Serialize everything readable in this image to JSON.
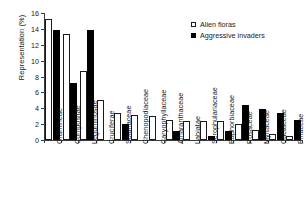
{
  "chart_data": {
    "type": "bar",
    "title": "",
    "xlabel": "",
    "ylabel": "Representation (%)",
    "ylim": [
      0,
      16
    ],
    "yticks": [
      0,
      2,
      4,
      6,
      8,
      10,
      12,
      14,
      16
    ],
    "grid": false,
    "legend_position": "top-right",
    "categories": [
      "Gramineae",
      "Compositae",
      "Leguminosae",
      "Cruciferae",
      "Solanaceae",
      "Chenopodiaceae",
      "Caryophyllaceae",
      "Amaranthaceae",
      "Labiatae",
      "Scrophulariaceae",
      "Euphorbiaceae",
      "Rosaceae",
      "Myrtaceae",
      "Cactaceae",
      "Pinaceae"
    ],
    "series": [
      {
        "name": "Alien floras",
        "style": "open",
        "color": "#ffffff",
        "edgecolor": "#1a1a1a",
        "values": [
          15.3,
          13.4,
          8.7,
          5.1,
          3.4,
          3.1,
          3.0,
          2.5,
          2.4,
          2.35,
          2.35,
          2.05,
          1.2,
          0.7,
          0.5
        ]
      },
      {
        "name": "Aggressive invaders",
        "style": "filled",
        "color": "#000000",
        "edgecolor": "#000000",
        "values": [
          13.8,
          7.2,
          13.9,
          0,
          2.05,
          0,
          0,
          1.1,
          0,
          0.55,
          1.1,
          4.45,
          3.9,
          3.45,
          2.5
        ]
      }
    ]
  },
  "legend": {
    "items": [
      {
        "label": "Alien floras",
        "style": "open"
      },
      {
        "label": "Aggressive invaders",
        "style": "filled"
      }
    ]
  }
}
